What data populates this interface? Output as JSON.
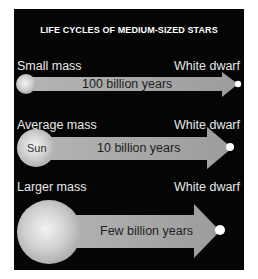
{
  "title": "LIFE CYCLES OF MEDIUM-SIZED STARS",
  "colors": {
    "background": "#050505",
    "arrow": "#a4a4a4",
    "star": "#d6d6d6",
    "white_dwarf": "#ffffff",
    "label": "#e8e8e8",
    "duration_text": "#1e1e1e"
  },
  "rows": [
    {
      "mass_label": "Small mass",
      "end_label": "White dwarf",
      "duration": "100 billion years",
      "star_label": ""
    },
    {
      "mass_label": "Average mass",
      "end_label": "White dwarf",
      "duration": "10 billion years",
      "star_label": "Sun"
    },
    {
      "mass_label": "Larger mass",
      "end_label": "White dwarf",
      "duration": "Few billion years",
      "star_label": ""
    }
  ]
}
